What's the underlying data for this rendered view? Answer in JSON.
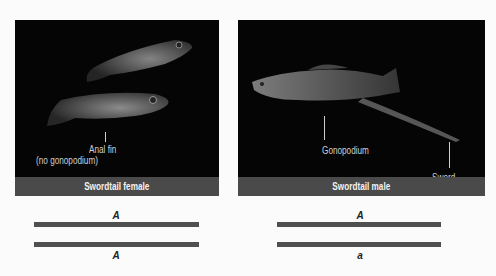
{
  "panels": [
    {
      "caption": "Swordtail female",
      "labels": {
        "anal_fin_line1": "Anal fin",
        "anal_fin_line2": "(no gonopodium)"
      },
      "alleles": {
        "top": "A",
        "bottom": "A"
      }
    },
    {
      "caption": "Swordtail male",
      "labels": {
        "gonopodium": "Gonopodium",
        "sword": "Sword"
      },
      "alleles": {
        "top": "A",
        "bottom": "a"
      }
    }
  ],
  "colors": {
    "photo_bg": "#050505",
    "caption_bar": "#4a4a4a",
    "chromosome": "#505050"
  }
}
